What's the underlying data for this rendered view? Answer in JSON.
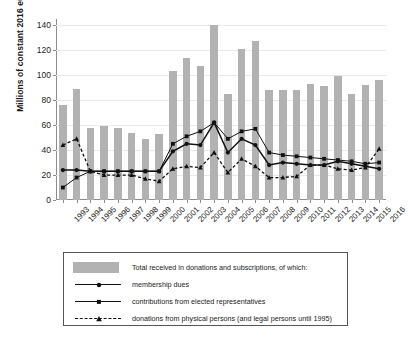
{
  "axes": {
    "ylabel": "Millions of constant 2016 euros",
    "yticks": [
      "0",
      "20",
      "40",
      "60",
      "80",
      "100",
      "120",
      "140"
    ]
  },
  "legend": {
    "items": [
      {
        "key": "bar",
        "label": "Total received in donations and subscriptions, of which:"
      },
      {
        "key": "circle-solid",
        "label": "membership dues"
      },
      {
        "key": "square-solid",
        "label": "contributions from elected representatives"
      },
      {
        "key": "triangle-dashed",
        "label": "donations from physical persons (and legal persons until 1995)"
      }
    ]
  },
  "chart_data": {
    "type": "bar",
    "title": "",
    "xlabel": "",
    "ylabel": "Millions of constant 2016 euros",
    "ylim": [
      0,
      145
    ],
    "yticks": [
      0,
      20,
      40,
      60,
      80,
      100,
      120,
      140
    ],
    "grid": true,
    "legend_position": "below",
    "categories": [
      "1993",
      "1994",
      "1995",
      "1996",
      "1997",
      "1998",
      "1999",
      "2000",
      "2001",
      "2002",
      "2003",
      "2004",
      "2005",
      "2006",
      "2007",
      "2008",
      "2009",
      "2010",
      "2011",
      "2012",
      "2013",
      "2014",
      "2015",
      "2016"
    ],
    "bar_series": {
      "name": "Total received in donations and subscriptions",
      "values": [
        76,
        89,
        58,
        59,
        58,
        54,
        49,
        53,
        103,
        114,
        107,
        140,
        85,
        121,
        127,
        88,
        88,
        88,
        93,
        91,
        99,
        85,
        92,
        96
      ]
    },
    "series": [
      {
        "name": "membership dues",
        "marker": "circle",
        "line": "solid",
        "values": [
          24,
          24,
          23,
          23,
          23,
          23,
          23,
          23,
          39,
          45,
          44,
          62,
          38,
          49,
          44,
          28,
          30,
          29,
          28,
          28,
          31,
          29,
          27,
          25
        ]
      },
      {
        "name": "contributions from elected representatives",
        "marker": "square",
        "line": "solid",
        "values": [
          10,
          18,
          23,
          23,
          23,
          23,
          23,
          23,
          45,
          51,
          55,
          62,
          49,
          55,
          57,
          38,
          36,
          35,
          34,
          33,
          32,
          31,
          29,
          30
        ]
      },
      {
        "name": "donations from physical persons (and legal persons until 1995)",
        "marker": "triangle",
        "line": "dashed",
        "values": [
          44,
          49,
          23,
          20,
          20,
          20,
          17,
          15,
          25,
          27,
          26,
          38,
          22,
          33,
          27,
          18,
          18,
          19,
          28,
          28,
          25,
          24,
          26,
          41
        ]
      }
    ]
  }
}
